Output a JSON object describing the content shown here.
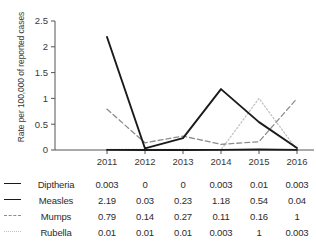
{
  "chart_data": {
    "type": "line",
    "title": "",
    "xlabel": "",
    "ylabel": "Rate per 100,000 of reported cases",
    "categories": [
      "2011",
      "2012",
      "2013",
      "2014",
      "2015",
      "2016"
    ],
    "ylim": [
      0,
      2.5
    ],
    "yticks": [
      "0",
      "0.5",
      "1",
      "1.5",
      "2",
      "2.5"
    ],
    "ytick_values": [
      0,
      0.5,
      1,
      1.5,
      2,
      2.5
    ],
    "grid": false,
    "legend_position": "left-table",
    "series": [
      {
        "name": "Diptheria",
        "style": "solid",
        "color": "#1a1a1a",
        "values": [
          0.003,
          0,
          0,
          0.003,
          0.01,
          0.003
        ],
        "labels": [
          "0.003",
          "0",
          "0",
          "0.003",
          "0.01",
          "0.003"
        ]
      },
      {
        "name": "Measles",
        "style": "solid",
        "color": "#1a1a1a",
        "values": [
          2.19,
          0.03,
          0.23,
          1.18,
          0.54,
          0.04
        ],
        "labels": [
          "2.19",
          "0.03",
          "0.23",
          "1.18",
          "0.54",
          "0.04"
        ]
      },
      {
        "name": "Mumps",
        "style": "dashed",
        "color": "#8c8c8c",
        "values": [
          0.79,
          0.14,
          0.27,
          0.11,
          0.16,
          1
        ],
        "labels": [
          "0.79",
          "0.14",
          "0.27",
          "0.11",
          "0.16",
          "1"
        ]
      },
      {
        "name": "Rubella",
        "style": "dotted",
        "color": "#c2c2c2",
        "values": [
          0.01,
          0.01,
          0.01,
          0.003,
          1,
          0.003
        ],
        "labels": [
          "0.01",
          "0.01",
          "0.01",
          "0.003",
          "1",
          "0.003"
        ]
      }
    ]
  },
  "axis": {
    "y_title": "Rate per 100,000 of reported cases"
  }
}
